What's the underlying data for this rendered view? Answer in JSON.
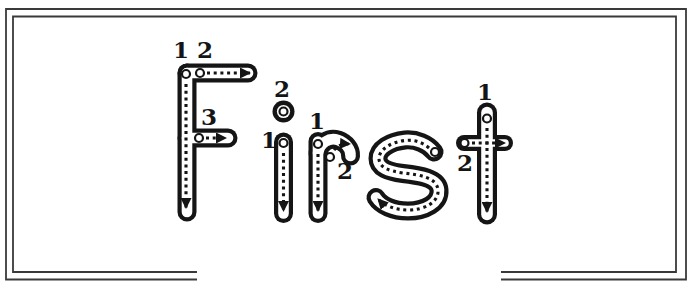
{
  "colors": {
    "ink": "#151515",
    "paper": "#ffffff",
    "frame_line": "#3a3a3a"
  },
  "worksheet": {
    "word": "First",
    "letters": [
      {
        "char": "F",
        "strokes": [
          "1",
          "2",
          "3"
        ]
      },
      {
        "char": "i",
        "strokes": [
          "1",
          "2"
        ]
      },
      {
        "char": "r",
        "strokes": [
          "1",
          "2"
        ]
      },
      {
        "char": "s",
        "strokes": []
      },
      {
        "char": "t",
        "strokes": [
          "1",
          "2"
        ]
      }
    ]
  }
}
